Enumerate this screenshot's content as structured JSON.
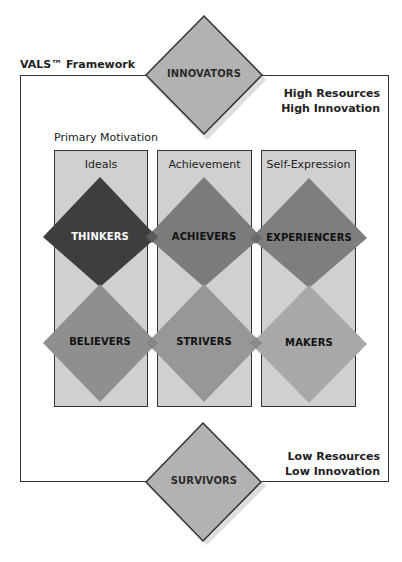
{
  "diagram": {
    "title": "VALS™ Framework",
    "top_right_label": [
      "High Resources",
      "High Innovation"
    ],
    "bottom_right_label": [
      "Low Resources",
      "Low Innovation"
    ],
    "axis_label": "Primary Motivation",
    "columns": [
      {
        "label": "Ideals"
      },
      {
        "label": "Achievement"
      },
      {
        "label": "Self-Expression"
      }
    ],
    "top_segment": {
      "label": "INNOVATORS",
      "color": "#b2b2b2",
      "text_color": "#2a2a2a"
    },
    "bottom_segment": {
      "label": "SURVIVORS",
      "color": "#b2b2b2",
      "text_color": "#2a2a2a"
    },
    "high_resource_segments": [
      {
        "label": "THINKERS",
        "color": "#3e3e3e",
        "text_color": "#ffffff"
      },
      {
        "label": "ACHIEVERS",
        "color": "#7b7b7b",
        "text_color": "#111111"
      },
      {
        "label": "EXPERIENCERS",
        "color": "#7e7e7e",
        "text_color": "#111111"
      }
    ],
    "low_resource_segments": [
      {
        "label": "BELIEVERS",
        "color": "#8f8f8f",
        "text_color": "#111111"
      },
      {
        "label": "STRIVERS",
        "color": "#979797",
        "text_color": "#111111"
      },
      {
        "label": "MAKERS",
        "color": "#a8a8a8",
        "text_color": "#111111"
      }
    ],
    "colors": {
      "frame": "#333333",
      "column_fill": "#d0d0d0",
      "background": "#ffffff"
    }
  }
}
